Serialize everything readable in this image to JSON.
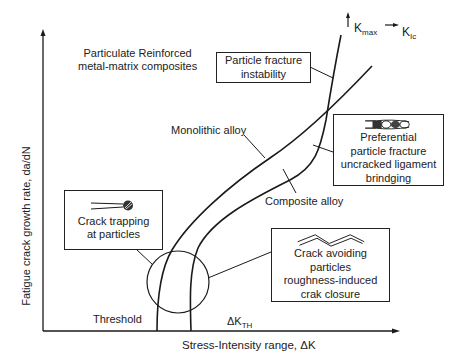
{
  "figure": {
    "title": "Particulate Reinforced metal-matrix composites",
    "title_lines": [
      "Particulate Reinforced",
      "metal-matrix composites"
    ],
    "axes": {
      "x_label": "Stress-Intensity range, ΔK",
      "y_label": "Fatigue crack growth rate, da/dN",
      "threshold_label": "Threshold",
      "delta_k_th": {
        "main": "ΔK",
        "sub": "TH"
      },
      "k_max": {
        "main": "K",
        "sub": "max"
      },
      "k_ic": {
        "main": "K",
        "sub": "Ic"
      }
    },
    "curves": [
      {
        "name": "Monolithic alloy",
        "label": "Monolithic alloy"
      },
      {
        "name": "Composite alloy",
        "label": "Composite alloy"
      }
    ],
    "callouts": [
      {
        "id": "particle-fracture",
        "lines": [
          "Particle fracture",
          "instability"
        ]
      },
      {
        "id": "preferential-fracture",
        "lines": [
          "Preferential",
          "particle fracture",
          "uncracked ligament",
          "brindging"
        ]
      },
      {
        "id": "crack-trapping",
        "lines": [
          "Crack trapping",
          "at particles"
        ]
      },
      {
        "id": "crack-avoiding",
        "lines": [
          "Crack avoiding",
          "particles",
          "roughness-induced",
          "crak closure"
        ]
      }
    ],
    "colors": {
      "line": "#1a1a1a",
      "background": "#ffffff"
    }
  }
}
